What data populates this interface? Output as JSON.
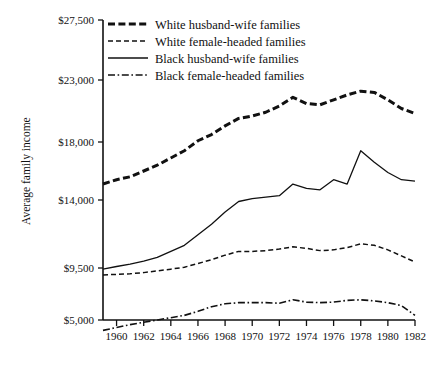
{
  "chart_data": {
    "type": "line",
    "title": "",
    "xlabel": "",
    "ylabel": "Average family income",
    "xlim": [
      1959,
      1982
    ],
    "ylim": [
      3400,
      27500
    ],
    "grid": false,
    "legend_position": "top-left-inside",
    "x": [
      1959,
      1960,
      1961,
      1962,
      1963,
      1964,
      1965,
      1966,
      1967,
      1968,
      1969,
      1970,
      1971,
      1972,
      1973,
      1974,
      1975,
      1976,
      1977,
      1978,
      1979,
      1980,
      1981,
      1982
    ],
    "xtick_labels": [
      "1960",
      "1962",
      "1964",
      "1966",
      "1968",
      "1970",
      "1972",
      "1974",
      "1976",
      "1978",
      "1980",
      "1982"
    ],
    "xticks": [
      1960,
      1962,
      1964,
      1966,
      1968,
      1970,
      1972,
      1974,
      1976,
      1978,
      1980,
      1982
    ],
    "ytick_labels": [
      "$5,000",
      "$9,500",
      "$14,000",
      "$18,000",
      "$23,000",
      "$27,500"
    ],
    "yticks": [
      5000,
      9500,
      14000,
      18000,
      23000,
      27500
    ],
    "series": [
      {
        "name": "White husband-wife families",
        "style": "thick-dashed",
        "values": [
          15100,
          15400,
          15600,
          16000,
          16400,
          16900,
          17400,
          18100,
          18600,
          19300,
          19900,
          20100,
          20400,
          20900,
          21600,
          21100,
          21000,
          21400,
          21800,
          22100,
          22000,
          21400,
          20700,
          20300
        ]
      },
      {
        "name": "White female-headed families",
        "style": "dashed",
        "values": [
          8900,
          8950,
          9000,
          9100,
          9250,
          9400,
          9550,
          9800,
          10050,
          10350,
          10600,
          10600,
          10650,
          10750,
          10900,
          10800,
          10650,
          10700,
          10850,
          11100,
          11000,
          10700,
          10300,
          9900
        ]
      },
      {
        "name": "Black husband-wife families",
        "style": "solid",
        "values": [
          9400,
          9600,
          9750,
          9950,
          10200,
          10600,
          11000,
          11700,
          12400,
          13200,
          13900,
          14100,
          14200,
          14300,
          15100,
          14800,
          14700,
          15400,
          15100,
          17400,
          16600,
          15900,
          15400,
          15300
        ]
      },
      {
        "name": "Black female-headed families",
        "style": "dash-dot",
        "values": [
          4100,
          4350,
          4600,
          4800,
          5000,
          5200,
          5400,
          5750,
          6150,
          6400,
          6500,
          6500,
          6500,
          6450,
          6750,
          6550,
          6500,
          6550,
          6700,
          6750,
          6650,
          6500,
          6250,
          5400
        ]
      }
    ]
  },
  "legend": {
    "items": [
      {
        "label": "White husband-wife families",
        "style": "thick-dashed"
      },
      {
        "label": "White female-headed families",
        "style": "dashed"
      },
      {
        "label": "Black husband-wife families",
        "style": "solid"
      },
      {
        "label": "Black female-headed families",
        "style": "dash-dot"
      }
    ]
  },
  "colors": {
    "ink": "#111111",
    "background": "#ffffff"
  }
}
